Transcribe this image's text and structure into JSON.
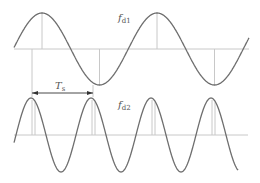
{
  "diagram": {
    "type": "waveform",
    "wave1": {
      "label": "f",
      "subscript": "d1",
      "axis_y": 49,
      "x_start": 14,
      "x_end": 249,
      "period_px": 115,
      "amplitude_px": 36,
      "phase_peak_x": 42
    },
    "wave2": {
      "label": "f",
      "subscript": "d2",
      "axis_y": 135,
      "x_start": 14,
      "x_end": 238,
      "period_px": 60,
      "amplitude_px": 37,
      "phase_peak_x": 31
    },
    "period_marker": {
      "label": "T",
      "subscript": "s",
      "x1": 32,
      "x2": 93,
      "y": 93
    },
    "colors": {
      "wave": "#6e6e6e",
      "axis": "#c8c8c8",
      "marker": "#c8c8c8",
      "arrow": "#333333"
    }
  }
}
